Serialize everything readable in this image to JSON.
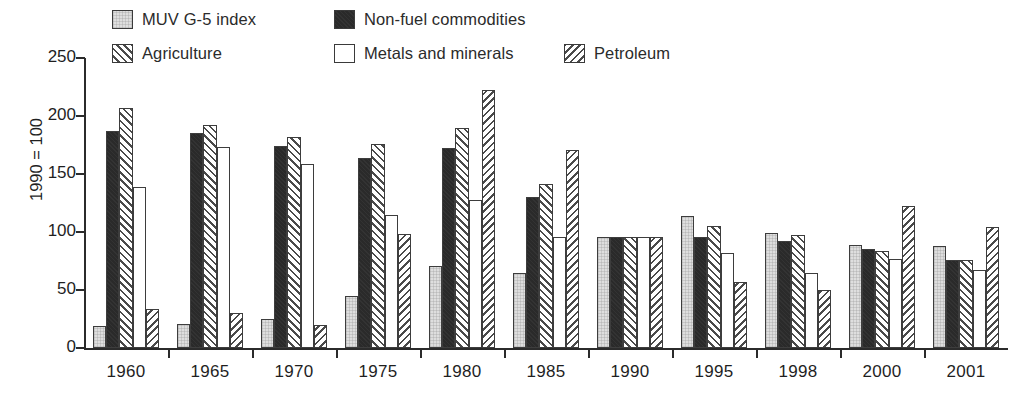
{
  "legend": {
    "items": [
      {
        "key": "muv",
        "label": "MUV G-5 index",
        "swatch": "light-gray-fill"
      },
      {
        "key": "nonfuel",
        "label": "Non-fuel commodities",
        "swatch": "black-fill"
      },
      {
        "key": "agri",
        "label": "Agriculture",
        "swatch": "forward-hatch"
      },
      {
        "key": "metals",
        "label": "Metals and minerals",
        "swatch": "white-fill"
      },
      {
        "key": "petro",
        "label": "Petroleum",
        "swatch": "back-hatch"
      }
    ]
  },
  "chart_data": {
    "type": "bar",
    "title": "",
    "xlabel": "",
    "ylabel": "1990 = 100",
    "ylim": [
      0,
      250
    ],
    "yticks": [
      0,
      50,
      100,
      150,
      200,
      250
    ],
    "grid": false,
    "legend_position": "top",
    "categories": [
      "1960",
      "1965",
      "1970",
      "1975",
      "1980",
      "1985",
      "1990",
      "1995",
      "1998",
      "2000",
      "2001"
    ],
    "series": [
      {
        "name": "MUV G-5 index",
        "values": [
          19,
          21,
          25,
          45,
          71,
          65,
          96,
          114,
          99,
          89,
          88
        ]
      },
      {
        "name": "Non-fuel commodities",
        "values": [
          187,
          185,
          174,
          164,
          172,
          130,
          96,
          96,
          92,
          85,
          76
        ]
      },
      {
        "name": "Agriculture",
        "values": [
          207,
          192,
          182,
          176,
          190,
          141,
          96,
          105,
          97,
          84,
          76
        ]
      },
      {
        "name": "Metals and minerals",
        "values": [
          139,
          173,
          159,
          115,
          128,
          96,
          96,
          82,
          65,
          77,
          67
        ]
      },
      {
        "name": "Petroleum",
        "values": [
          34,
          30,
          20,
          98,
          222,
          171,
          96,
          57,
          50,
          122,
          104
        ]
      }
    ]
  }
}
